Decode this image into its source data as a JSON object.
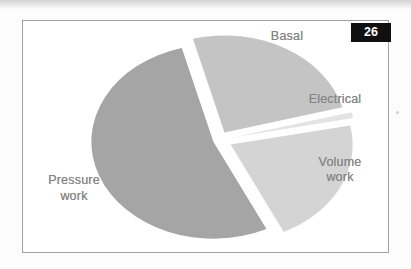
{
  "page": {
    "slide_number": "26"
  },
  "chart_data": {
    "type": "pie",
    "title": "",
    "slices": [
      {
        "label": "Basal",
        "value": 25,
        "color": "#c4c4c4"
      },
      {
        "label": "Electrical",
        "value": 1,
        "color": "#e3e3e3"
      },
      {
        "label": "Volume work",
        "value": 21,
        "color": "#d4d4d4"
      },
      {
        "label": "Pressure work",
        "value": 53,
        "color": "#a5a5a5"
      }
    ],
    "values_are_percent_estimates": true,
    "start_angle_deg": -15,
    "direction": "clockwise",
    "exploded": true,
    "explode_px": [
      11,
      15,
      13,
      6
    ],
    "legend": "none",
    "labels_position": "outside"
  }
}
